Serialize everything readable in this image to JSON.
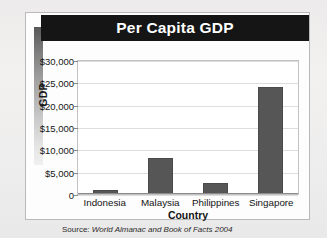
{
  "card": {
    "title": "Per Capita GDP",
    "source_label": "Source:",
    "source_text": "World Almanac and Book of Facts 2004"
  },
  "colors": {
    "banner_background": "#151515",
    "banner_text": "#ffffff",
    "bar_fill": "#565656",
    "bar_border": "#4a4a4a",
    "gridline": "#dddddd",
    "plot_background": "#ffffff",
    "card_background": "#fdfdfd",
    "page_background": "#f0efee"
  },
  "chart_data": {
    "type": "bar",
    "title": "Per Capita GDP",
    "xlabel": "Country",
    "ylabel": "GDP",
    "categories": [
      "Indonesia",
      "Malaysia",
      "Philippines",
      "Singapore"
    ],
    "values": [
      800,
      8000,
      2400,
      24000
    ],
    "ylim": [
      0,
      30000
    ],
    "ytick_values": [
      30000,
      25000,
      20000,
      15000,
      10000,
      5000,
      0
    ],
    "ytick_labels": [
      "$30,000",
      "$25,000",
      "$20,000",
      "$15,000",
      "$10,000",
      "$5,000",
      "0"
    ],
    "grid": true,
    "grid_axis": "y",
    "legend": false,
    "legend_position": "none",
    "source": "Source: World Almanac and Book of Facts 2004"
  }
}
